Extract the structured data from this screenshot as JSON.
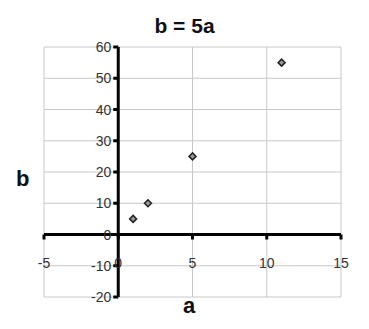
{
  "chart_data": {
    "type": "scatter",
    "title": "b = 5a",
    "xlabel": "a",
    "ylabel": "b",
    "xlim": [
      -5,
      15
    ],
    "ylim": [
      -20,
      60
    ],
    "x_ticks": [
      -5,
      0,
      5,
      10,
      15
    ],
    "y_ticks": [
      -20,
      -10,
      0,
      10,
      20,
      30,
      40,
      50,
      60
    ],
    "grid": true,
    "legend": "none",
    "series": [
      {
        "name": "b",
        "marker": "diamond",
        "color": "#222222",
        "points": [
          {
            "x": 1,
            "y": 5
          },
          {
            "x": 2,
            "y": 10
          },
          {
            "x": 5,
            "y": 25
          },
          {
            "x": 11,
            "y": 55
          }
        ]
      }
    ]
  }
}
